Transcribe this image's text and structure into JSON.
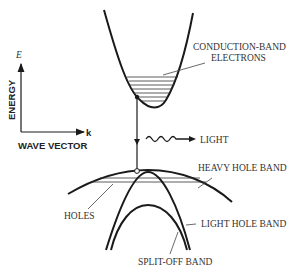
{
  "axes": {
    "y_label": "ENERGY",
    "y_symbol": "E",
    "x_symbol": "k",
    "x_label": "WAVE VECTOR"
  },
  "labels": {
    "conduction_line1": "CONDUCTION-BAND",
    "conduction_line2": "ELECTRONS",
    "light": "LIGHT",
    "heavy_hole": "HEAVY HOLE BAND",
    "holes": "HOLES",
    "light_hole": "LIGHT HOLE BAND",
    "split_off": "SPLIT-OFF BAND"
  },
  "colors": {
    "line": "#1a1a1a",
    "text": "#333333",
    "background": "#ffffff"
  }
}
